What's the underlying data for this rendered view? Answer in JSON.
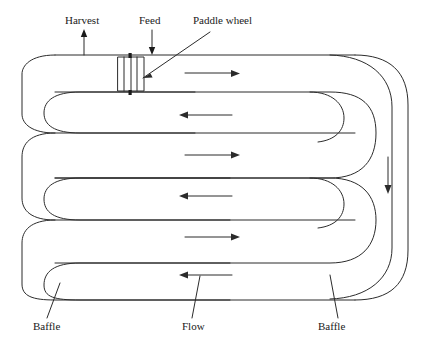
{
  "figure": {
    "type": "schematic-diagram",
    "stroke_color": "#2b2b2b",
    "background_color": "#ffffff"
  },
  "labels": {
    "harvest": "Harvest",
    "feed": "Feed",
    "paddle_wheel": "Paddle wheel",
    "baffle_left": "Baffle",
    "flow": "Flow",
    "baffle_right": "Baffle"
  },
  "annotations": {
    "harvest_arrow_direction": "up",
    "feed_arrow_direction": "down",
    "right_channel_arrow_direction": "down",
    "channel_flow_directions": [
      "right",
      "left",
      "right",
      "left",
      "right",
      "left"
    ]
  },
  "components": {
    "paddle_wheel_blades": 4,
    "baffle_count": 2,
    "channel_count": 6
  }
}
